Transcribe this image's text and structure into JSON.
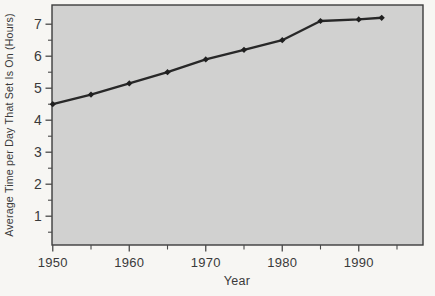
{
  "chart_data": {
    "type": "line",
    "title": "",
    "xlabel": "Year",
    "ylabel": "Average Time per Day That Set Is On (Hours)",
    "series": [
      {
        "name": "Average time per day TV set is on (hours)",
        "x": [
          1950,
          1955,
          1960,
          1965,
          1970,
          1975,
          1980,
          1985,
          1990,
          1993
        ],
        "values": [
          4.5,
          4.8,
          5.15,
          5.5,
          5.9,
          6.2,
          6.5,
          7.1,
          7.15,
          7.2
        ]
      }
    ],
    "xlim": [
      1949.9,
      1998.4
    ],
    "ylim": [
      0.1,
      7.6
    ],
    "x_major_ticks": [
      1950,
      1960,
      1970,
      1980,
      1990
    ],
    "x_minor_ticks": [
      1955,
      1965,
      1975,
      1985,
      1995
    ],
    "y_major_ticks": [
      7,
      6,
      5,
      4,
      3,
      2,
      1
    ],
    "y_minor_ticks": [
      6.5,
      5.5,
      4.5,
      3.5,
      2.5,
      1.5,
      0.5
    ],
    "grid": false,
    "legend": false,
    "marker": "diamond",
    "colors": {
      "page_background": "#f7f6f3",
      "plot_background": "#d1d1d0",
      "plot_border": "#3d3d3d",
      "line": "#282828",
      "marker": "#1f1f1f",
      "tick": "#4a4a4a",
      "text": "#3a3a3a"
    }
  }
}
